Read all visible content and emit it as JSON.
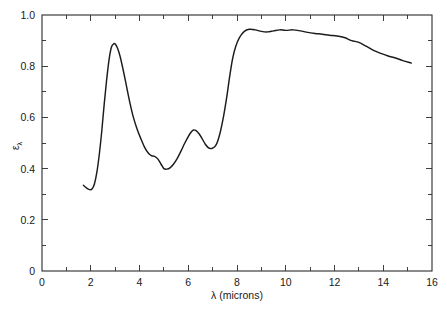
{
  "chart_data": {
    "type": "line",
    "title": "",
    "xlabel": "λ (microns)",
    "ylabel": "ε",
    "ylabel_sub": "λ",
    "xlim": [
      0,
      16
    ],
    "ylim": [
      0,
      1.0
    ],
    "grid": false,
    "legend": "none",
    "x_major_ticks": [
      0,
      2,
      4,
      6,
      8,
      10,
      12,
      14,
      16
    ],
    "x_major_tick_labels": [
      "0",
      "2",
      "4",
      "6",
      "8",
      "10",
      "12",
      "14",
      "16"
    ],
    "x_minor_tick_step": 1,
    "y_major_ticks": [
      0,
      0.2,
      0.4,
      0.6,
      0.8,
      1.0
    ],
    "y_major_tick_labels": [
      "0",
      "0.2",
      "0.4",
      "0.6",
      "0.8",
      "1.0"
    ],
    "y_minor_tick_step": 0.1,
    "series": [
      {
        "name": "spectral emissivity",
        "color": "#1b1b1b",
        "x": [
          1.7,
          1.82,
          1.95,
          2.05,
          2.15,
          2.25,
          2.35,
          2.45,
          2.55,
          2.65,
          2.75,
          2.85,
          2.95,
          3.02,
          3.1,
          3.2,
          3.32,
          3.45,
          3.6,
          3.75,
          3.9,
          4.05,
          4.2,
          4.35,
          4.5,
          4.62,
          4.75,
          4.88,
          5.0,
          5.12,
          5.25,
          5.4,
          5.55,
          5.7,
          5.85,
          6.0,
          6.12,
          6.22,
          6.32,
          6.45,
          6.58,
          6.7,
          6.82,
          6.92,
          7.0,
          7.1,
          7.2,
          7.32,
          7.45,
          7.58,
          7.7,
          7.82,
          7.95,
          8.1,
          8.3,
          8.5,
          8.75,
          9.0,
          9.25,
          9.5,
          9.75,
          10.0,
          10.3,
          10.6,
          10.9,
          11.2,
          11.5,
          11.8,
          12.1,
          12.4,
          12.7,
          13.0,
          13.3,
          13.6,
          13.9,
          14.2,
          14.5,
          14.8,
          15.15
        ],
        "y": [
          0.335,
          0.325,
          0.318,
          0.32,
          0.34,
          0.385,
          0.455,
          0.545,
          0.65,
          0.745,
          0.825,
          0.875,
          0.888,
          0.885,
          0.87,
          0.84,
          0.79,
          0.73,
          0.66,
          0.6,
          0.555,
          0.518,
          0.485,
          0.462,
          0.45,
          0.448,
          0.438,
          0.418,
          0.4,
          0.398,
          0.403,
          0.418,
          0.44,
          0.468,
          0.498,
          0.525,
          0.543,
          0.551,
          0.548,
          0.535,
          0.515,
          0.495,
          0.482,
          0.478,
          0.48,
          0.487,
          0.505,
          0.545,
          0.605,
          0.68,
          0.76,
          0.83,
          0.878,
          0.912,
          0.936,
          0.944,
          0.942,
          0.936,
          0.934,
          0.938,
          0.942,
          0.94,
          0.942,
          0.938,
          0.932,
          0.928,
          0.925,
          0.921,
          0.918,
          0.912,
          0.9,
          0.893,
          0.878,
          0.862,
          0.85,
          0.84,
          0.832,
          0.822,
          0.812
        ]
      }
    ],
    "annotations": {
      "peak_1": {
        "x": 2.98,
        "y": 0.888
      },
      "valley_1": {
        "x": 5.03,
        "y": 0.398
      },
      "peak_2": {
        "x": 6.22,
        "y": 0.551
      },
      "valley_2": {
        "x": 6.92,
        "y": 0.478
      },
      "plateau_max": {
        "x": 8.5,
        "y": 0.944
      },
      "curve_start": {
        "x": 1.7,
        "y": 0.335
      },
      "curve_end": {
        "x": 15.15,
        "y": 0.812
      }
    }
  }
}
